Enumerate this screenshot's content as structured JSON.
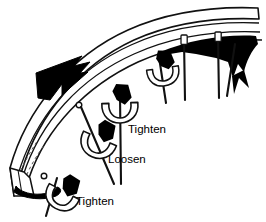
{
  "figure": {
    "background_color": "#ffffff",
    "ink_color": "#000000",
    "line_color": "#1a1a1a",
    "shade_color": "#000000"
  },
  "labels": [
    {
      "id": "tighten-upper",
      "text": "Tighten",
      "x": 128,
      "y": 129
    },
    {
      "id": "loosen",
      "text": "Loosen",
      "x": 108,
      "y": 159
    },
    {
      "id": "tighten-lower",
      "text": "Tighten",
      "x": 76,
      "y": 201
    }
  ],
  "annotations": {
    "direction_arrow": "black-arrowhead-pointing-upper-left",
    "rim_cutaway": "rim-cross-section-at-lower-left-end"
  },
  "parts": {
    "rim_label": "rim",
    "spoke_label": "spoke",
    "nipple_label": "nipple",
    "wrench_label": "spoke wrench"
  },
  "spokes": [
    {
      "id": "spoke-1",
      "x1": 58,
      "y1": 180,
      "x2": 44,
      "y2": 214
    },
    {
      "id": "spoke-2",
      "x1": 83,
      "y1": 106,
      "x2": 113,
      "y2": 182
    },
    {
      "id": "spoke-3",
      "x1": 120,
      "y1": 92,
      "x2": 120,
      "y2": 182
    },
    {
      "id": "spoke-4",
      "x1": 160,
      "y1": 56,
      "x2": 166,
      "y2": 100
    },
    {
      "id": "spoke-5",
      "x1": 184,
      "y1": 38,
      "x2": 185,
      "y2": 98
    },
    {
      "id": "spoke-6",
      "x1": 218,
      "y1": 36,
      "x2": 218,
      "y2": 96
    },
    {
      "id": "spoke-7",
      "x1": 236,
      "y1": 42,
      "x2": 227,
      "y2": 94
    }
  ],
  "wrenches": [
    {
      "id": "wrench-tighten-upper",
      "cx": 119,
      "cy": 108
    },
    {
      "id": "wrench-loosen",
      "cx": 98,
      "cy": 143
    },
    {
      "id": "wrench-tighten-lower",
      "cx": 62,
      "cy": 195
    },
    {
      "id": "wrench-upper-right",
      "cx": 163,
      "cy": 72
    }
  ]
}
